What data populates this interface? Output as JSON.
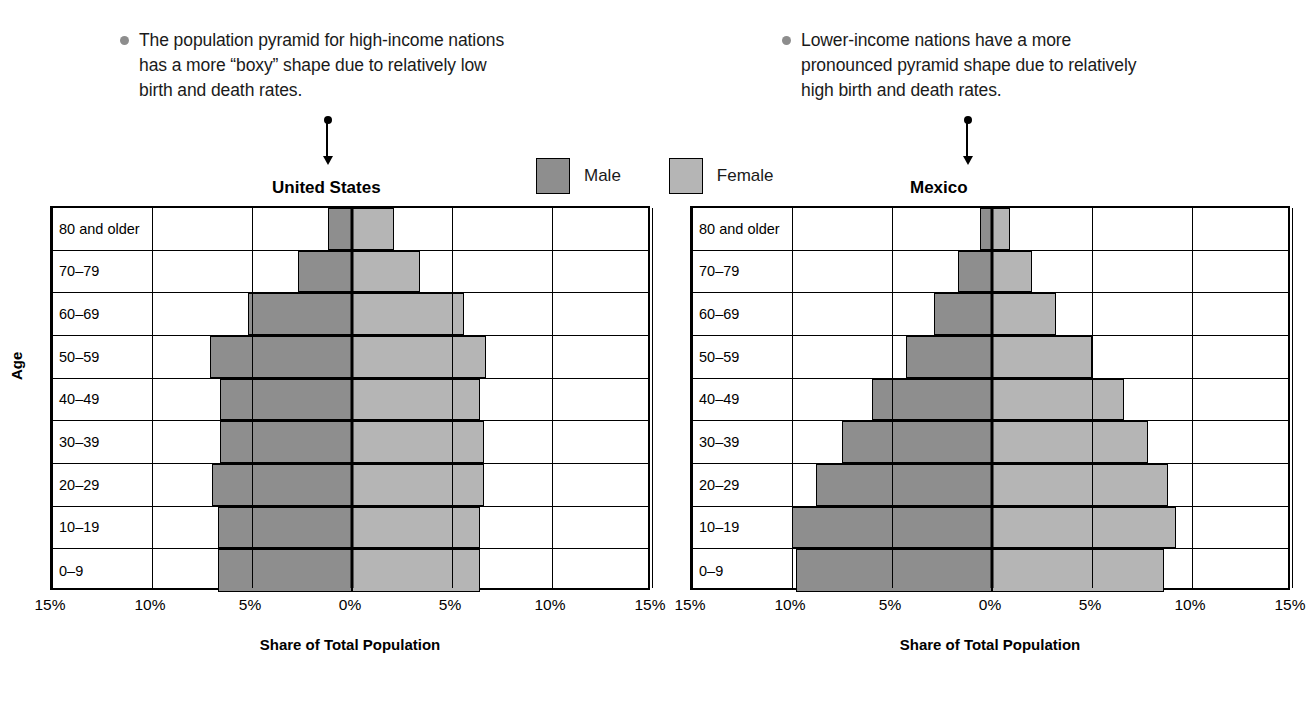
{
  "annotations": [
    {
      "id": "us",
      "text": "The population pyramid for high-income nations has a more “boxy” shape due to relatively low birth and death rates."
    },
    {
      "id": "mx",
      "text": "Lower-income nations have a more pronounced pyramid shape due to relatively high birth and death rates."
    }
  ],
  "legend": {
    "position": "top-center",
    "entries": [
      {
        "label": "Male",
        "color": "#8e8e8e"
      },
      {
        "label": "Female",
        "color": "#b5b5b5"
      }
    ]
  },
  "axis": {
    "y_label": "Age",
    "x_label": "Share of Total Population",
    "x_ticks": [
      "15%",
      "10%",
      "5%",
      "0%",
      "5%",
      "10%",
      "15%"
    ]
  },
  "chart_data": [
    {
      "type": "bar",
      "subtype": "population-pyramid",
      "title": "United States",
      "xlabel": "Share of Total Population",
      "ylabel": "Age",
      "categories": [
        "80 and older",
        "70–79",
        "60–69",
        "50–59",
        "40–49",
        "30–39",
        "20–29",
        "10–19",
        "0–9"
      ],
      "series": [
        {
          "name": "Male",
          "color": "#8e8e8e",
          "values": [
            1.2,
            2.7,
            5.2,
            7.1,
            6.6,
            6.6,
            7.0,
            6.7,
            6.7
          ]
        },
        {
          "name": "Female",
          "color": "#b5b5b5",
          "values": [
            2.1,
            3.4,
            5.6,
            6.7,
            6.4,
            6.6,
            6.6,
            6.4,
            6.4
          ]
        }
      ],
      "xlim": [
        -15,
        15
      ],
      "x_ticks": [
        -15,
        -10,
        -5,
        0,
        5,
        10,
        15
      ],
      "x_tick_labels": [
        "15%",
        "10%",
        "5%",
        "0%",
        "5%",
        "10%",
        "15%"
      ],
      "grid": true,
      "legend_position": "top-center"
    },
    {
      "type": "bar",
      "subtype": "population-pyramid",
      "title": "Mexico",
      "xlabel": "Share of Total Population",
      "ylabel": "Age",
      "categories": [
        "80 and older",
        "70–79",
        "60–69",
        "50–59",
        "40–49",
        "30–39",
        "20–29",
        "10–19",
        "0–9"
      ],
      "series": [
        {
          "name": "Male",
          "color": "#8e8e8e",
          "values": [
            0.6,
            1.7,
            2.9,
            4.3,
            6.0,
            7.5,
            8.8,
            10.0,
            9.8
          ]
        },
        {
          "name": "Female",
          "color": "#b5b5b5",
          "values": [
            0.9,
            2.0,
            3.2,
            5.0,
            6.6,
            7.8,
            8.8,
            9.2,
            8.6
          ]
        }
      ],
      "xlim": [
        -15,
        15
      ],
      "x_ticks": [
        -15,
        -10,
        -5,
        0,
        5,
        10,
        15
      ],
      "x_tick_labels": [
        "15%",
        "10%",
        "5%",
        "0%",
        "5%",
        "10%",
        "15%"
      ],
      "grid": true,
      "legend_position": "top-center"
    }
  ]
}
